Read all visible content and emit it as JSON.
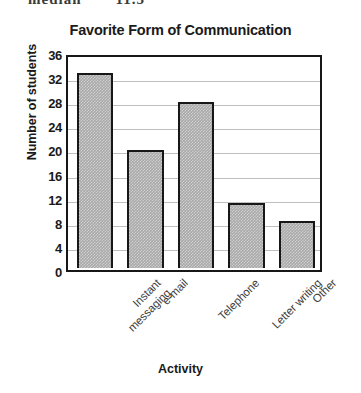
{
  "page": {
    "cropped_text_top": "median",
    "cropped_text_top_2": "11.5",
    "axis_label_x": "Activity",
    "axis_label_y": "Number of students"
  },
  "chart_data": {
    "type": "bar",
    "title": "Favorite Form of Communication",
    "xlabel": "Activity",
    "ylabel": "Number of students",
    "categories": [
      "Instant\nmessaging",
      "e-mail",
      "Telephone",
      "Letter writing",
      "Other"
    ],
    "values": [
      33,
      20,
      28,
      11,
      8
    ],
    "ylim": [
      0,
      36
    ],
    "yticks": [
      0,
      4,
      8,
      12,
      16,
      20,
      24,
      28,
      32,
      36
    ],
    "ytick_labels": [
      "0",
      "4",
      "8",
      "12",
      "16",
      "20",
      "24",
      "28",
      "32",
      "36"
    ],
    "grid": true,
    "legend": null,
    "bar_fill_color": "#a9a9a9",
    "bar_edge_color": "#171717",
    "gridline_color": "#bfbfbf",
    "background_color": "#ffffff"
  }
}
